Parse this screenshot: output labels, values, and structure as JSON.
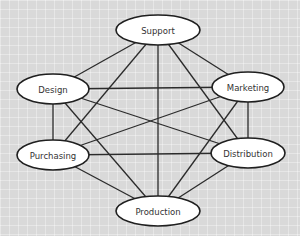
{
  "diagram": {
    "type": "network",
    "background_color": "#d9d9d9",
    "line_color": "#2b2b2b",
    "nodes": [
      {
        "id": "support",
        "label": "Support",
        "cx": 158,
        "cy": 30,
        "rx": 42,
        "ry": 15
      },
      {
        "id": "design",
        "label": "Design",
        "cx": 53,
        "cy": 89,
        "rx": 36,
        "ry": 15
      },
      {
        "id": "marketing",
        "label": "Marketing",
        "cx": 248,
        "cy": 87,
        "rx": 36,
        "ry": 15
      },
      {
        "id": "purchasing",
        "label": "Purchasing",
        "cx": 53,
        "cy": 155,
        "rx": 36,
        "ry": 15
      },
      {
        "id": "distribution",
        "label": "Distribution",
        "cx": 248,
        "cy": 153,
        "rx": 37,
        "ry": 15
      },
      {
        "id": "production",
        "label": "Production",
        "cx": 158,
        "cy": 211,
        "rx": 42,
        "ry": 15
      }
    ],
    "edges": [
      [
        "support",
        "design"
      ],
      [
        "support",
        "marketing"
      ],
      [
        "support",
        "purchasing"
      ],
      [
        "support",
        "distribution"
      ],
      [
        "support",
        "production"
      ],
      [
        "design",
        "marketing"
      ],
      [
        "design",
        "purchasing"
      ],
      [
        "design",
        "distribution"
      ],
      [
        "design",
        "production"
      ],
      [
        "marketing",
        "purchasing"
      ],
      [
        "marketing",
        "distribution"
      ],
      [
        "marketing",
        "production"
      ],
      [
        "purchasing",
        "distribution"
      ],
      [
        "purchasing",
        "production"
      ],
      [
        "distribution",
        "production"
      ]
    ]
  }
}
